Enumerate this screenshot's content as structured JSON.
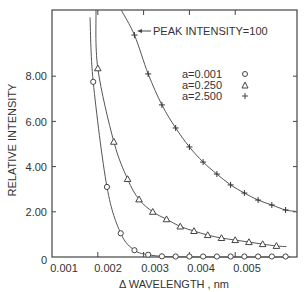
{
  "chart_data": {
    "type": "scatter",
    "title": "",
    "xlabel": "Δ WAVELENGTH , nm",
    "ylabel": "RELATIVE INTENSITY",
    "xlim": [
      0.001,
      0.00634
    ],
    "ylim": [
      0,
      10.9
    ],
    "x_ticks": [
      0.001,
      0.002,
      0.003,
      0.004,
      0.005
    ],
    "x_tick_labels": [
      "0.001",
      "0.002",
      "0.003",
      "0.004",
      "0.005"
    ],
    "y_ticks": [
      0,
      2,
      4,
      6,
      8
    ],
    "y_tick_labels": [
      "0",
      "2.00",
      "4.00",
      "6.00",
      "8.00"
    ],
    "grid": false,
    "annotations": [
      {
        "text": "PEAK INTENSITY=100",
        "arrow_to": [
          0.0028,
          9.8
        ]
      }
    ],
    "legend_position": "upper right",
    "series": [
      {
        "name": "a=0.001",
        "marker": "circle",
        "x": [
          0.0019,
          0.0022,
          0.0025,
          0.0028,
          0.0031,
          0.0034,
          0.0037,
          0.004,
          0.0043,
          0.0046,
          0.0049,
          0.0052,
          0.0055,
          0.0058,
          0.0061
        ],
        "values": [
          7.75,
          3.1,
          1.05,
          0.3,
          0.1,
          0.03,
          0.01,
          0.0,
          0.0,
          0.0,
          0.0,
          0.0,
          0.0,
          0.0,
          0.0
        ]
      },
      {
        "name": "a=0.250",
        "marker": "triangle",
        "x": [
          0.002,
          0.00235,
          0.00265,
          0.0029,
          0.0032,
          0.0035,
          0.0038,
          0.0041,
          0.0044,
          0.0047,
          0.005,
          0.0053,
          0.0056,
          0.0059
        ],
        "values": [
          8.35,
          5.1,
          3.45,
          2.55,
          2.0,
          1.67,
          1.35,
          1.15,
          0.97,
          0.84,
          0.75,
          0.66,
          0.57,
          0.49
        ]
      },
      {
        "name": "a=2.500",
        "marker": "plus",
        "x": [
          0.0028,
          0.0031,
          0.0034,
          0.0037,
          0.004,
          0.0043,
          0.0046,
          0.0049,
          0.0052,
          0.0055,
          0.0058,
          0.0061
        ],
        "values": [
          9.82,
          8.1,
          6.73,
          5.71,
          4.87,
          4.2,
          3.67,
          3.19,
          2.83,
          2.52,
          2.3,
          2.08
        ]
      }
    ]
  },
  "labels": {
    "annotation": "PEAK INTENSITY=100",
    "legend": [
      "a=0.001",
      "a=0.250",
      "a=2.500"
    ],
    "xlabel": "Δ WAVELENGTH , nm",
    "ylabel": "RELATIVE INTENSITY",
    "x_ticks": [
      "0.001",
      "0.002",
      "0.003",
      "0.004",
      "0.005"
    ],
    "y_ticks": [
      "0",
      "2.00",
      "4.00",
      "6.00",
      "8.00"
    ]
  }
}
